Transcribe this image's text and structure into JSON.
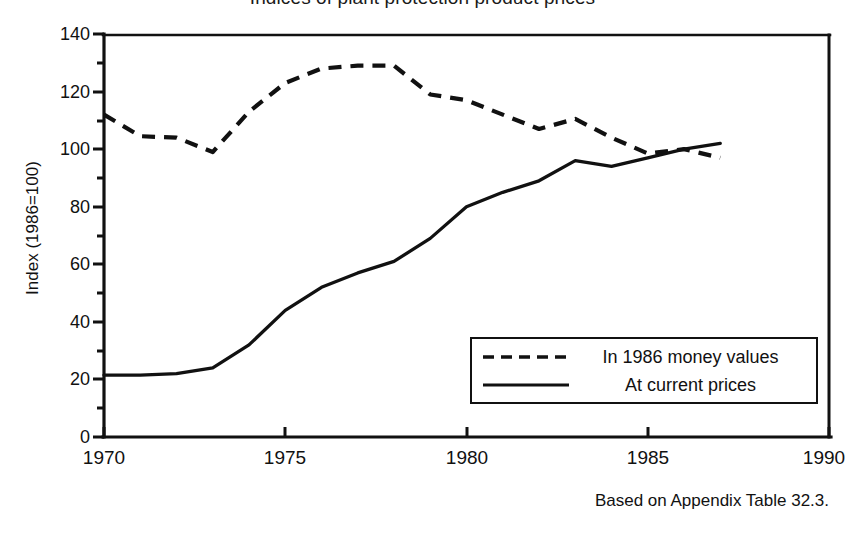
{
  "chart_data": {
    "type": "line",
    "title": "Indices of plant protection product prices",
    "xlabel": "",
    "ylabel": "Index (1986=100)",
    "xlim": [
      1970,
      1990
    ],
    "ylim": [
      0,
      140
    ],
    "grid": false,
    "legend_position": "inside-lower-right",
    "x_ticks": [
      1970,
      1975,
      1980,
      1985,
      1990
    ],
    "y_ticks": [
      0,
      20,
      40,
      60,
      80,
      100,
      120,
      140
    ],
    "y_minor_ticks": [
      10,
      30,
      50,
      70,
      90,
      110,
      130
    ],
    "x": [
      1970,
      1971,
      1972,
      1973,
      1974,
      1975,
      1976,
      1977,
      1978,
      1979,
      1980,
      1981,
      1982,
      1983,
      1984,
      1985,
      1986,
      1987
    ],
    "series": [
      {
        "name": "In 1986 money values",
        "style": "dashed",
        "color": "#111111",
        "values": [
          112,
          104.5,
          104,
          99,
          113,
          123,
          128,
          129,
          129,
          119,
          117,
          112,
          107,
          110.5,
          104,
          98.5,
          100,
          97
        ]
      },
      {
        "name": "At current prices",
        "style": "solid",
        "color": "#111111",
        "values": [
          21.5,
          21.5,
          22,
          24,
          32,
          44,
          52,
          57,
          61,
          69,
          80,
          85,
          89,
          96,
          94,
          97,
          100,
          102
        ]
      }
    ],
    "annotations": [
      "Based on Appendix Table 32.3."
    ]
  },
  "chart": {
    "title": "Indices of plant protection product prices",
    "y_axis_title": "Index (1986=100)",
    "footnote": "Based on Appendix Table 32.3.",
    "y_tick_labels": [
      "140",
      "120",
      "100",
      "80",
      "60",
      "40",
      "20",
      "0"
    ],
    "x_tick_labels": [
      "1970",
      "1975",
      "1980",
      "1985",
      "1990"
    ],
    "legend": {
      "entries": [
        {
          "label": "In 1986 money values",
          "style": "dashed"
        },
        {
          "label": "At current prices",
          "style": "solid"
        }
      ]
    },
    "colors": {
      "axis": "#111111",
      "series_1986_money_values": "#111111",
      "series_current_prices": "#111111",
      "background": "#ffffff"
    }
  }
}
